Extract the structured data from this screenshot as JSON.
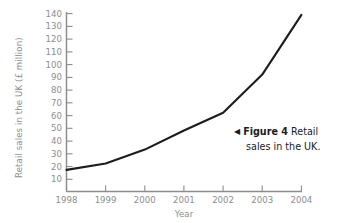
{
  "figure": {
    "caption_arrow_icon": "triangle-left-icon",
    "caption_label": "Figure 4",
    "caption_text_line1": "Retail",
    "caption_text_line2": "sales in the UK.",
    "caption_full": "Figure 4 Retail sales in the UK."
  },
  "colors": {
    "line": "#1c1c1c",
    "axis": "#8d8d8d",
    "tick_label": "#8d8d8d",
    "caption_text": "#1c1c1c",
    "background": "#ffffff"
  },
  "chart_data": {
    "type": "line",
    "title": "",
    "xlabel": "Year",
    "ylabel": "Retail sales in the UK (£ million)",
    "categories": [
      "1998",
      "1999",
      "2000",
      "2001",
      "2002",
      "2003",
      "2004"
    ],
    "x": [
      1998,
      1999,
      2000,
      2001,
      2002,
      2003,
      2004
    ],
    "values": [
      17,
      22,
      33,
      48,
      62,
      92,
      139
    ],
    "ytick_labels": [
      "10",
      "20",
      "30",
      "40",
      "50",
      "60",
      "70",
      "80",
      "90",
      "100",
      "110",
      "120",
      "130",
      "140"
    ],
    "yticks": [
      10,
      20,
      30,
      40,
      50,
      60,
      70,
      80,
      90,
      100,
      110,
      120,
      130,
      140
    ],
    "xtick_labels": [
      "1998",
      "1999",
      "2000",
      "2001",
      "2002",
      "2003",
      "2004"
    ],
    "ylim": [
      0,
      145
    ],
    "xlim": [
      1998,
      2004
    ],
    "grid": false,
    "legend": false,
    "legend_position": "none",
    "series": [
      {
        "name": "Retail sales in the UK (£ million)",
        "values": [
          17,
          22,
          33,
          48,
          62,
          92,
          139
        ]
      }
    ],
    "annotations": [
      "Figure 4 Retail sales in the UK."
    ]
  }
}
